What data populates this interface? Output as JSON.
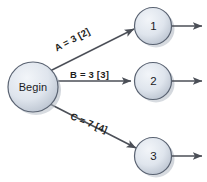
{
  "diagram": {
    "background_color": "#ffffff",
    "node_fill_light": "#e9edf3",
    "node_fill_dark": "#aab4c2",
    "node_stroke": "#5a6372",
    "shadow_color": "#9aa3b0",
    "edge_color": "#4b4f57",
    "text_color": "#1b1b1f"
  },
  "nodes": {
    "begin": {
      "label": "Begin",
      "cx": 33,
      "cy": 87,
      "r": 25
    },
    "n1": {
      "label": "1",
      "cx": 153,
      "cy": 26,
      "r": 18.5
    },
    "n2": {
      "label": "2",
      "cx": 153,
      "cy": 81,
      "r": 18.5
    },
    "n3": {
      "label": "3",
      "cx": 153,
      "cy": 156,
      "r": 18.5
    }
  },
  "edges": [
    {
      "id": "edge-a",
      "from": "begin",
      "to": "n1",
      "label": "A = 3 [2]",
      "duration": 3,
      "float": 2,
      "rotation_deg": -28
    },
    {
      "id": "edge-b",
      "from": "begin",
      "to": "n2",
      "label": "B = 3 [3]",
      "duration": 3,
      "float": 3,
      "rotation_deg": 0
    },
    {
      "id": "edge-c",
      "from": "begin",
      "to": "n3",
      "label": "C = 7 [4]",
      "duration": 7,
      "float": 4,
      "rotation_deg": 22
    }
  ],
  "exit_arrows": [
    {
      "id": "exit-arrow-1",
      "from": "n1"
    },
    {
      "id": "exit-arrow-2",
      "from": "n2"
    },
    {
      "id": "exit-arrow-3",
      "from": "n3"
    }
  ]
}
